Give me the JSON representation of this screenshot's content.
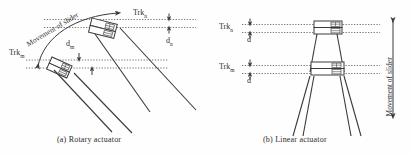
{
  "figure": {
    "panels": [
      {
        "id": "rotary",
        "caption": "(a) Rotary actuator",
        "movement_label": "Movement of slider",
        "track_upper": "Trk",
        "track_upper_sub": "n",
        "track_lower": "Trk",
        "track_lower_sub": "m",
        "dim_upper": "d",
        "dim_upper_sub": "n",
        "dim_lower": "d",
        "dim_lower_sub": "m"
      },
      {
        "id": "linear",
        "caption": "(b) Linear actuator",
        "movement_label": "Movement of slider",
        "track_upper": "Trk",
        "track_upper_sub": "n",
        "track_lower": "Trk",
        "track_lower_sub": "m",
        "dim_upper": "d",
        "dim_lower": "d"
      }
    ],
    "colors": {
      "ink": "#3a3a3a",
      "dotted": "#555555",
      "fill": "#ffffff",
      "head_detail": "#4a4a4a",
      "background": "#ffffff"
    }
  }
}
